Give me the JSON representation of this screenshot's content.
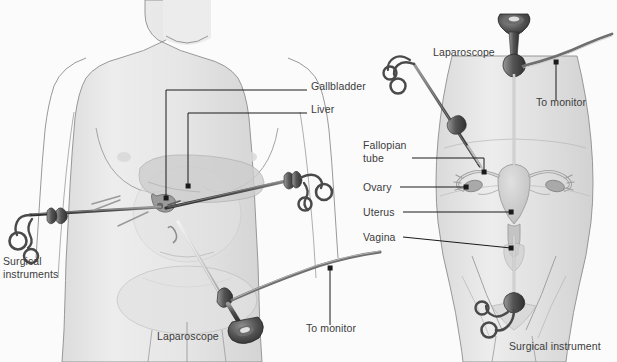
{
  "figure": {
    "kind": "medical-illustration",
    "background_color": "#fbfbfb",
    "body_fill": "#e9e9e9",
    "body_outline": "#8d8d8d",
    "organ_fill": "#cfcfcf",
    "instrument_dark": "#4a4a4a",
    "instrument_mid": "#7a7a7a",
    "label_color": "#3b3b3b",
    "leader_color": "#1a1a1a"
  },
  "panels": [
    {
      "id": "left-panel",
      "name": "laparoscopic-cholecystectomy",
      "labels": [
        {
          "id": "gallbladder",
          "text": "Gallbladder",
          "x": 311,
          "y": 86,
          "lines": 1
        },
        {
          "id": "liver",
          "text": "Liver",
          "x": 311,
          "y": 109,
          "lines": 1
        },
        {
          "id": "surgical-instruments",
          "text": "Surgical\ninstruments",
          "x": 3,
          "y": 261,
          "lines": 2
        },
        {
          "id": "laparoscope",
          "text": "Laparoscope",
          "x": 157,
          "y": 336,
          "lines": 1
        },
        {
          "id": "to-monitor",
          "text": "To monitor",
          "x": 306,
          "y": 321,
          "lines": 1
        }
      ]
    },
    {
      "id": "right-panel",
      "name": "gynecologic-laparoscopy",
      "labels": [
        {
          "id": "laparoscope-r",
          "text": "Laparoscope",
          "x": 433,
          "y": 52,
          "lines": 1
        },
        {
          "id": "to-monitor-r",
          "text": "To monitor",
          "x": 536,
          "y": 96,
          "lines": 1
        },
        {
          "id": "fallopian-tube",
          "text": "Fallopian\ntube",
          "x": 363,
          "y": 141,
          "lines": 2
        },
        {
          "id": "ovary",
          "text": "Ovary",
          "x": 363,
          "y": 183,
          "lines": 1
        },
        {
          "id": "uterus",
          "text": "Uterus",
          "x": 363,
          "y": 208,
          "lines": 1
        },
        {
          "id": "vagina",
          "text": "Vagina",
          "x": 363,
          "y": 233,
          "lines": 1
        },
        {
          "id": "surgical-instrument",
          "text": "Surgical instrument",
          "x": 509,
          "y": 343,
          "lines": 1
        }
      ]
    }
  ]
}
